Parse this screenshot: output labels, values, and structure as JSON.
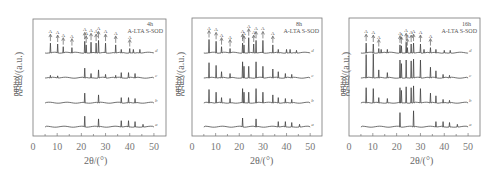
{
  "chart_data": [
    {
      "type": "line",
      "title": "4h",
      "subtitle": "A-LTA S-SOD",
      "xlabel": "2θ/(°)",
      "ylabel": "强度/(a.u.)",
      "xlim": [
        0,
        55
      ],
      "xticks": [
        0,
        10,
        20,
        30,
        40,
        50
      ],
      "grid": false,
      "series": [
        {
          "name": "a",
          "peaks": [
            [
              21.4,
              0.6
            ],
            [
              27.1,
              0.45
            ],
            [
              36.5,
              0.35
            ],
            [
              39.5,
              0.35
            ],
            [
              42.2,
              0.3
            ],
            [
              45.5,
              0.15
            ]
          ]
        },
        {
          "name": "b",
          "peaks": [
            [
              21.4,
              0.55
            ],
            [
              27.1,
              0.45
            ],
            [
              36.5,
              0.3
            ],
            [
              39.5,
              0.3
            ],
            [
              42.2,
              0.25
            ]
          ]
        },
        {
          "name": "c",
          "peaks": [
            [
              7.2,
              0.15
            ],
            [
              10.2,
              0.12
            ],
            [
              21.4,
              0.55
            ],
            [
              24.0,
              0.25
            ],
            [
              27.1,
              0.45
            ],
            [
              30.0,
              0.2
            ],
            [
              34.2,
              0.15
            ],
            [
              36.5,
              0.3
            ],
            [
              39.5,
              0.3
            ],
            [
              42.2,
              0.25
            ]
          ]
        },
        {
          "name": "d",
          "peaks": [
            [
              7.2,
              0.55
            ],
            [
              10.2,
              0.5
            ],
            [
              12.5,
              0.35
            ],
            [
              16.1,
              0.3
            ],
            [
              21.4,
              0.65
            ],
            [
              22.0,
              0.45
            ],
            [
              24.0,
              0.6
            ],
            [
              26.1,
              0.55
            ],
            [
              27.1,
              0.7
            ],
            [
              30.0,
              0.55
            ],
            [
              34.2,
              0.45
            ],
            [
              36.5,
              0.2
            ],
            [
              40.0,
              0.25
            ],
            [
              41.5,
              0.2
            ],
            [
              44.2,
              0.2
            ]
          ]
        }
      ],
      "annotations": {
        "d": "A peaks marked with arrows (A-LTA), S peaks (S-SOD)"
      }
    },
    {
      "type": "line",
      "title": "8h",
      "subtitle": "A-LTA S-SOD",
      "xlabel": "2θ/(°)",
      "ylabel": "强度/(a.u.)",
      "xlim": [
        0,
        55
      ],
      "xticks": [
        0,
        10,
        20,
        30,
        40,
        50
      ],
      "grid": false,
      "series": [
        {
          "name": "a",
          "peaks": [
            [
              21.4,
              0.5
            ],
            [
              27.1,
              0.45
            ],
            [
              36.5,
              0.3
            ],
            [
              39.5,
              0.3
            ],
            [
              42.2,
              0.25
            ],
            [
              45.5,
              0.15
            ]
          ]
        },
        {
          "name": "b",
          "peaks": [
            [
              7.2,
              0.75
            ],
            [
              10.2,
              0.6
            ],
            [
              12.5,
              0.3
            ],
            [
              16.1,
              0.25
            ],
            [
              21.4,
              0.8
            ],
            [
              22.0,
              0.6
            ],
            [
              24.0,
              0.6
            ],
            [
              27.1,
              0.8
            ],
            [
              30.0,
              0.6
            ],
            [
              34.2,
              0.45
            ],
            [
              36.5,
              0.3
            ],
            [
              39.5,
              0.25
            ],
            [
              42.2,
              0.2
            ]
          ]
        },
        {
          "name": "c",
          "peaks": [
            [
              7.2,
              0.85
            ],
            [
              10.2,
              0.7
            ],
            [
              12.5,
              0.35
            ],
            [
              16.1,
              0.25
            ],
            [
              21.4,
              0.9
            ],
            [
              22.0,
              0.65
            ],
            [
              24.0,
              0.65
            ],
            [
              27.1,
              0.9
            ],
            [
              30.0,
              0.65
            ],
            [
              34.2,
              0.5
            ],
            [
              36.5,
              0.35
            ],
            [
              39.5,
              0.25
            ],
            [
              42.2,
              0.2
            ]
          ]
        },
        {
          "name": "d",
          "peaks": [
            [
              7.2,
              0.75
            ],
            [
              10.2,
              0.65
            ],
            [
              12.5,
              0.35
            ],
            [
              16.1,
              0.25
            ],
            [
              21.4,
              0.55
            ],
            [
              22.0,
              0.45
            ],
            [
              24.0,
              0.85
            ],
            [
              26.1,
              0.5
            ],
            [
              27.1,
              0.7
            ],
            [
              30.0,
              0.7
            ],
            [
              34.2,
              0.45
            ],
            [
              36.5,
              0.2
            ],
            [
              40.0,
              0.2
            ],
            [
              41.5,
              0.2
            ],
            [
              44.2,
              0.15
            ]
          ]
        }
      ]
    },
    {
      "type": "line",
      "title": "16h",
      "subtitle": "A-LTA S-SOD",
      "xlabel": "2θ/(°)",
      "ylabel": "强度/(a.u.)",
      "xlim": [
        0,
        55
      ],
      "xticks": [
        0,
        10,
        20,
        30,
        40,
        50
      ],
      "grid": false,
      "series": [
        {
          "name": "a",
          "peaks": [
            [
              21.4,
              0.8
            ],
            [
              27.1,
              0.9
            ],
            [
              36.5,
              0.3
            ],
            [
              39.5,
              0.3
            ],
            [
              42.2,
              0.25
            ],
            [
              45.5,
              0.15
            ]
          ]
        },
        {
          "name": "b",
          "peaks": [
            [
              7.2,
              0.85
            ],
            [
              10.2,
              0.8
            ],
            [
              12.5,
              0.3
            ],
            [
              16.1,
              0.25
            ],
            [
              21.4,
              0.85
            ],
            [
              22.0,
              0.7
            ],
            [
              24.0,
              0.9
            ],
            [
              26.1,
              0.85
            ],
            [
              27.1,
              0.95
            ],
            [
              30.0,
              0.8
            ],
            [
              34.2,
              0.55
            ],
            [
              36.5,
              0.4
            ],
            [
              39.5,
              0.2
            ],
            [
              42.2,
              0.15
            ]
          ]
        },
        {
          "name": "c",
          "peaks": [
            [
              7.2,
              1.3
            ],
            [
              10.2,
              1.35
            ],
            [
              12.5,
              0.45
            ],
            [
              16.1,
              0.3
            ],
            [
              21.4,
              1.0
            ],
            [
              22.0,
              0.8
            ],
            [
              24.0,
              1.0
            ],
            [
              26.1,
              0.95
            ],
            [
              27.1,
              1.05
            ],
            [
              30.0,
              1.0
            ],
            [
              34.2,
              0.6
            ],
            [
              36.5,
              0.4
            ],
            [
              39.5,
              0.2
            ],
            [
              42.2,
              0.15
            ]
          ]
        },
        {
          "name": "d",
          "peaks": [
            [
              7.2,
              0.55
            ],
            [
              10.2,
              0.5
            ],
            [
              12.5,
              0.25
            ],
            [
              13.5,
              0.2
            ],
            [
              16.1,
              0.2
            ],
            [
              21.4,
              0.45
            ],
            [
              22.0,
              0.4
            ],
            [
              24.0,
              0.6
            ],
            [
              24.5,
              0.3
            ],
            [
              26.1,
              0.5
            ],
            [
              27.1,
              0.55
            ],
            [
              30.0,
              0.5
            ],
            [
              31.5,
              0.2
            ],
            [
              34.2,
              0.3
            ],
            [
              36.5,
              0.2
            ],
            [
              40.0,
              0.15
            ],
            [
              42.5,
              0.15
            ]
          ]
        }
      ],
      "annotations": {
        "d": "Labels: A, A, A S A, A, A S, S A, A, S, A, A, A"
      }
    }
  ],
  "panels": [
    {
      "title": "4h",
      "legend": "A-LTA S-SOD",
      "ylabel": "强度/(a.u.)",
      "xlabel": "2θ/(°)",
      "ticks": [
        "0",
        "10",
        "20",
        "30",
        "40",
        "50"
      ],
      "curves": [
        "a",
        "b",
        "c",
        "d"
      ]
    },
    {
      "title": "8h",
      "legend": "A-LTA S-SOD",
      "ylabel": "强度/(a.u.)",
      "xlabel": "2θ/(°)",
      "ticks": [
        "0",
        "10",
        "20",
        "30",
        "40",
        "50"
      ],
      "curves": [
        "a",
        "b",
        "c",
        "d"
      ]
    },
    {
      "title": "16h",
      "legend": "A-LTA S-SOD",
      "ylabel": "强度/(a.u.)",
      "xlabel": "2θ/(°)",
      "ticks": [
        "0",
        "10",
        "20",
        "30",
        "40",
        "50"
      ],
      "curves": [
        "a",
        "b",
        "c",
        "d"
      ]
    }
  ]
}
